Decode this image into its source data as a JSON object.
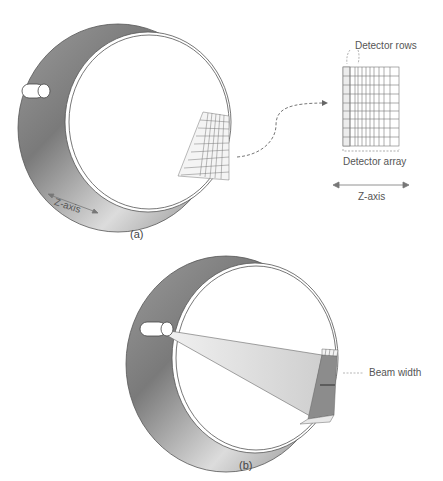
{
  "panels": [
    {
      "id": "a",
      "caption": "(a)",
      "ring_labels": {
        "axis": "Z-axis"
      },
      "inset": {
        "top_label": "Detector rows",
        "bottom_label": "Detector array",
        "axis_label": "Z-axis",
        "columns": 12,
        "rows": 9
      }
    },
    {
      "id": "b",
      "caption": "(b)",
      "labels": {
        "beam": "Beam width"
      }
    }
  ],
  "colors": {
    "ring_dark": "#6e6e6e",
    "ring_light": "#e6e6e6",
    "line": "#555555",
    "beam": "#d9d9d9",
    "text": "#555555"
  }
}
